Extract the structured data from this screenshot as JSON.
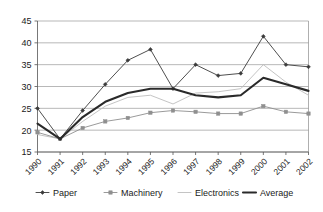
{
  "chart_data": {
    "type": "line",
    "title": "",
    "subtitle": "",
    "xlabel": "",
    "ylabel": "",
    "grid": true,
    "legend_position": "bottom",
    "categories": [
      "1990",
      "1991",
      "1992",
      "1993",
      "1994",
      "1995",
      "1996",
      "1997",
      "1998",
      "1999",
      "2000",
      "2001",
      "2002"
    ],
    "ylim": [
      15,
      45
    ],
    "yticks": [
      15,
      20,
      25,
      30,
      35,
      40,
      45
    ],
    "series": [
      {
        "name": "Paper",
        "color": "#3b3b3b",
        "marker": "diamond",
        "values": [
          25.0,
          18.0,
          24.5,
          30.5,
          36.0,
          38.5,
          29.5,
          35.0,
          32.5,
          33.0,
          41.5,
          35.0,
          34.5
        ]
      },
      {
        "name": "Machinery",
        "color": "#8f8f8f",
        "marker": "square",
        "values": [
          19.5,
          18.0,
          20.5,
          22.0,
          22.8,
          24.0,
          24.5,
          24.2,
          23.8,
          23.8,
          25.5,
          24.2,
          23.8
        ]
      },
      {
        "name": "Electronics",
        "color": "#bdbdbd",
        "marker": "none",
        "values": [
          19.0,
          18.0,
          22.0,
          25.5,
          27.5,
          28.0,
          26.0,
          28.5,
          28.8,
          29.5,
          35.0,
          31.0,
          28.0
        ]
      },
      {
        "name": "Average",
        "color": "#2a2a2a",
        "marker": "none",
        "values": [
          21.5,
          18.0,
          23.0,
          26.5,
          28.5,
          29.5,
          29.5,
          28.0,
          27.5,
          28.0,
          32.0,
          30.5,
          29.0
        ]
      }
    ]
  },
  "legend": {
    "items": [
      {
        "label": "Paper"
      },
      {
        "label": "Machinery"
      },
      {
        "label": "Electronics"
      },
      {
        "label": "Average"
      }
    ]
  },
  "axis": {
    "y_tick_labels": [
      "45",
      "40",
      "35",
      "30",
      "25",
      "20",
      "15"
    ],
    "x_tick_labels": [
      "1990",
      "1991",
      "1992",
      "1993",
      "1994",
      "1995",
      "1996",
      "1997",
      "1998",
      "1999",
      "2000",
      "2001",
      "2002"
    ]
  }
}
